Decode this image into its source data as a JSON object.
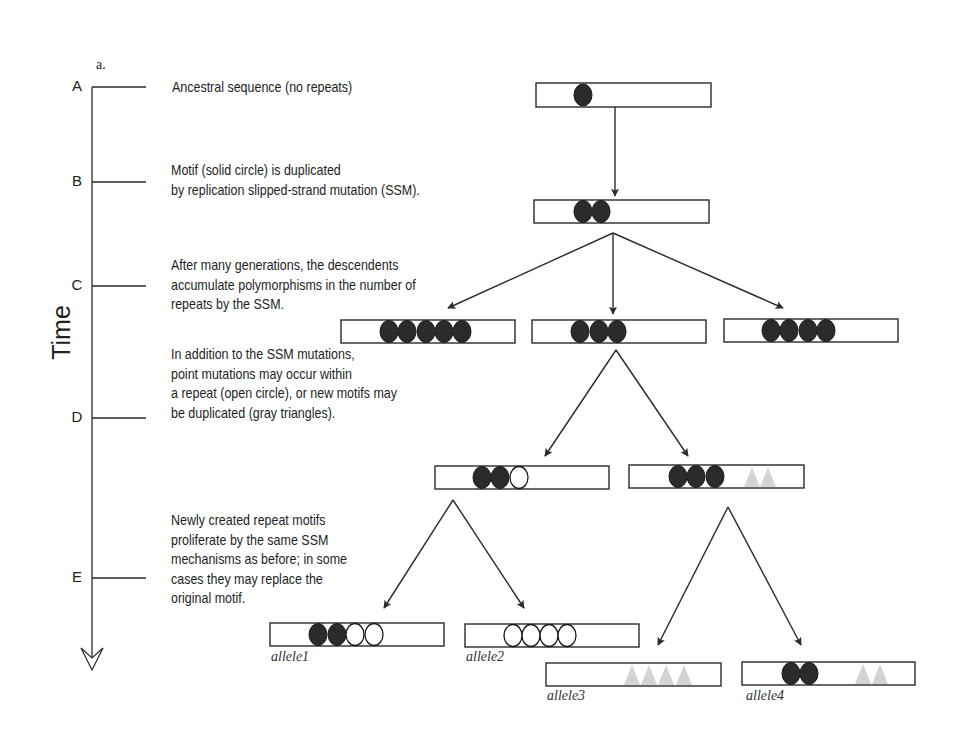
{
  "figure": {
    "panel_label": "a.",
    "axis_label": "Time",
    "colors": {
      "line": "#2a2a2a",
      "solid_motif": "#2b2b2b",
      "open_motif_fill": "#ffffff",
      "gray_triangle": "#d4d4d4",
      "background": "#ffffff"
    },
    "stages": [
      {
        "letter": "A",
        "y": 87,
        "description": [
          "Ancestral sequence (no repeats)"
        ]
      },
      {
        "letter": "B",
        "y": 182,
        "description": [
          "Motif (solid circle) is duplicated",
          "by replication slipped-strand mutation (SSM)."
        ]
      },
      {
        "letter": "C",
        "y": 286,
        "description": [
          "After many generations, the descendents",
          "accumulate polymorphisms in the number of",
          "repeats by the SSM."
        ]
      },
      {
        "letter": "D",
        "y": 418,
        "description": [
          "In addition to the SSM mutations,",
          "point mutations may occur within",
          "a repeat (open circle), or new motifs may",
          "be duplicated (gray triangles)."
        ]
      },
      {
        "letter": "E",
        "y": 578,
        "description": [
          "Newly created repeat motifs",
          "proliferate by the same SSM",
          "mechanisms as before; in some",
          "cases they may replace the",
          "original motif."
        ]
      }
    ],
    "sequences": [
      {
        "id": "A",
        "x": 536,
        "y": 83,
        "w": 175,
        "h": 24,
        "motifs": [
          {
            "type": "solid",
            "x": 583
          }
        ]
      },
      {
        "id": "B",
        "x": 534,
        "y": 200,
        "w": 175,
        "h": 23,
        "motifs": [
          {
            "type": "solid",
            "x": 583
          },
          {
            "type": "solid",
            "x": 601
          }
        ]
      },
      {
        "id": "C1",
        "x": 341,
        "y": 320,
        "w": 174,
        "h": 23,
        "motifs": [
          {
            "type": "solid",
            "x": 389
          },
          {
            "type": "solid",
            "x": 407
          },
          {
            "type": "solid",
            "x": 426
          },
          {
            "type": "solid",
            "x": 444
          },
          {
            "type": "solid",
            "x": 462
          }
        ]
      },
      {
        "id": "C2",
        "x": 532,
        "y": 320,
        "w": 174,
        "h": 23,
        "motifs": [
          {
            "type": "solid",
            "x": 580
          },
          {
            "type": "solid",
            "x": 599
          },
          {
            "type": "solid",
            "x": 617
          }
        ]
      },
      {
        "id": "C3",
        "x": 724,
        "y": 319,
        "w": 174,
        "h": 23,
        "motifs": [
          {
            "type": "solid",
            "x": 771
          },
          {
            "type": "solid",
            "x": 789
          },
          {
            "type": "solid",
            "x": 808
          },
          {
            "type": "solid",
            "x": 826
          }
        ]
      },
      {
        "id": "D1",
        "x": 435,
        "y": 466,
        "w": 174,
        "h": 23,
        "motifs": [
          {
            "type": "solid",
            "x": 482
          },
          {
            "type": "solid",
            "x": 500
          },
          {
            "type": "open",
            "x": 519
          }
        ]
      },
      {
        "id": "D2",
        "x": 629,
        "y": 465,
        "w": 175,
        "h": 23,
        "motifs": [
          {
            "type": "solid",
            "x": 678
          },
          {
            "type": "solid",
            "x": 696
          },
          {
            "type": "solid",
            "x": 715
          },
          {
            "type": "triangle",
            "x": 752
          },
          {
            "type": "triangle",
            "x": 768
          }
        ]
      },
      {
        "id": "allele1",
        "label": "allele1",
        "x": 270,
        "y": 623,
        "w": 174,
        "h": 23,
        "motifs": [
          {
            "type": "solid",
            "x": 318
          },
          {
            "type": "solid",
            "x": 337
          },
          {
            "type": "open",
            "x": 355
          },
          {
            "type": "open",
            "x": 374
          }
        ]
      },
      {
        "id": "allele2",
        "label": "allele2",
        "x": 465,
        "y": 624,
        "w": 174,
        "h": 23,
        "motifs": [
          {
            "type": "open",
            "x": 513
          },
          {
            "type": "open",
            "x": 531
          },
          {
            "type": "open",
            "x": 549
          },
          {
            "type": "open",
            "x": 567
          }
        ]
      },
      {
        "id": "allele3",
        "label": "allele3",
        "x": 546,
        "y": 663,
        "w": 175,
        "h": 23,
        "motifs": [
          {
            "type": "triangle",
            "x": 632
          },
          {
            "type": "triangle",
            "x": 649
          },
          {
            "type": "triangle",
            "x": 666
          },
          {
            "type": "triangle",
            "x": 684
          }
        ]
      },
      {
        "id": "allele4",
        "label": "allele4",
        "x": 742,
        "y": 662,
        "w": 173,
        "h": 23,
        "motifs": [
          {
            "type": "solid",
            "x": 791
          },
          {
            "type": "solid",
            "x": 809
          },
          {
            "type": "triangle",
            "x": 863
          },
          {
            "type": "triangle",
            "x": 880
          }
        ]
      }
    ],
    "arrows": [
      {
        "from": "A",
        "x1": 615,
        "y1": 107,
        "x2": 615,
        "y2": 196
      },
      {
        "from": "B",
        "x1": 613,
        "y1": 233,
        "x2": 448,
        "y2": 308
      },
      {
        "from": "B",
        "x1": 613,
        "y1": 233,
        "x2": 613,
        "y2": 314
      },
      {
        "from": "B",
        "x1": 613,
        "y1": 233,
        "x2": 783,
        "y2": 308
      },
      {
        "from": "C2",
        "x1": 616,
        "y1": 350,
        "x2": 545,
        "y2": 456
      },
      {
        "from": "C2",
        "x1": 616,
        "y1": 350,
        "x2": 688,
        "y2": 456
      },
      {
        "from": "D1",
        "x1": 453,
        "y1": 500,
        "x2": 384,
        "y2": 608
      },
      {
        "from": "D1",
        "x1": 453,
        "y1": 500,
        "x2": 524,
        "y2": 608
      },
      {
        "from": "D2",
        "x1": 728,
        "y1": 507,
        "x2": 658,
        "y2": 645
      },
      {
        "from": "D2",
        "x1": 728,
        "y1": 507,
        "x2": 801,
        "y2": 645
      }
    ],
    "allele_labels": [
      {
        "text": "allele1",
        "x": 271,
        "y": 652
      },
      {
        "text": "allele2",
        "x": 466,
        "y": 652
      },
      {
        "text": "allele3",
        "x": 547,
        "y": 691
      },
      {
        "text": "allele4",
        "x": 746,
        "y": 691
      }
    ]
  }
}
